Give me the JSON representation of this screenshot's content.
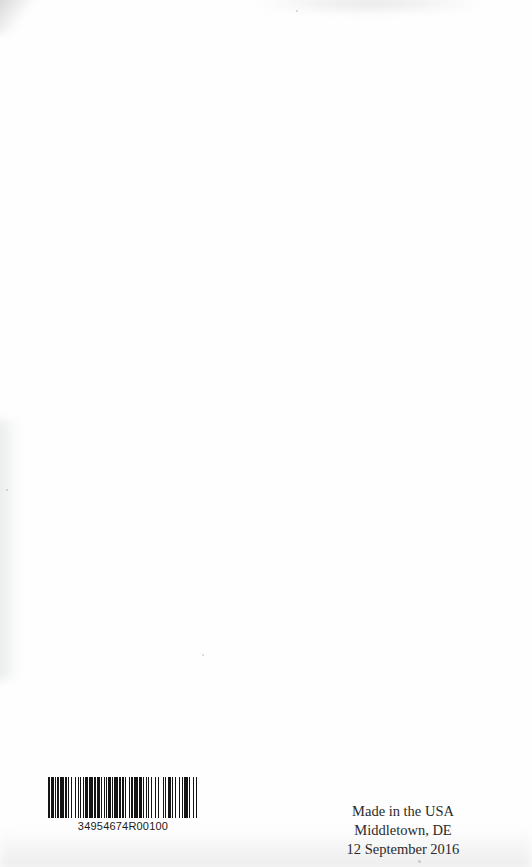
{
  "page": {
    "kind": "book-back-cover-scan",
    "background_color": "#fefefe",
    "ink_color": "#2a2a2a",
    "width": 532,
    "height": 867
  },
  "barcode": {
    "symbology": "code-128",
    "number": "34954674R00100",
    "bar_color": "#141414",
    "pattern": "2131112141211213121112113141213112112131114121211311214131121112131214111231121312114113121",
    "modules": [
      2,
      1,
      3,
      1,
      1,
      1,
      2,
      1,
      4,
      1,
      2,
      1,
      1,
      2,
      1,
      3,
      1,
      2,
      1,
      1,
      1,
      2,
      1,
      1,
      3,
      1,
      4,
      1,
      2,
      1,
      3,
      1,
      1,
      2,
      1,
      1,
      2,
      1,
      3,
      1,
      1,
      1,
      4,
      1,
      2,
      1,
      2,
      1,
      1,
      3,
      1,
      1,
      2,
      1,
      4,
      1,
      3,
      1,
      1,
      2,
      1,
      1,
      1,
      2,
      1,
      3,
      1,
      2,
      1,
      4,
      1,
      1,
      1,
      2,
      3,
      1,
      1,
      2,
      1,
      3,
      1,
      2,
      1,
      1,
      4,
      1,
      1,
      3,
      1,
      2,
      1
    ]
  },
  "imprint": {
    "lines": [
      "Made in the USA",
      "Middletown, DE",
      "12 September 2016"
    ],
    "line1": "Made in the USA",
    "line2": "Middletown, DE",
    "line3": "12 September 2016"
  }
}
